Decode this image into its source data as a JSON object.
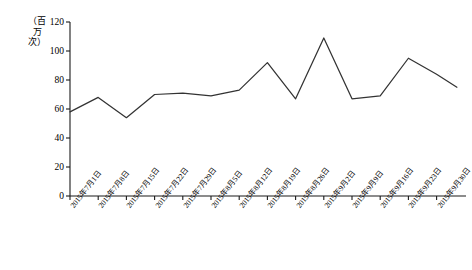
{
  "chart_data": {
    "type": "line",
    "title": "",
    "xlabel": "",
    "ylabel": "（百万次）",
    "ylim": [
      0,
      120
    ],
    "yticks": [
      0,
      20,
      40,
      60,
      80,
      100,
      120
    ],
    "grid": false,
    "legend": null,
    "series_color": "#333333",
    "categories": [
      "2015年7月1日",
      "2015年7月8日",
      "2015年7月15日",
      "2015年7月22日",
      "2015年7月29日",
      "2015年8月5日",
      "2015年8月12日",
      "2015年8月19日",
      "2015年8月26日",
      "2015年9月2日",
      "2015年9月9日",
      "2015年9月16日",
      "2015年9月23日",
      "2015年9月30日"
    ],
    "values": [
      58,
      68,
      54,
      70,
      71,
      69,
      73,
      92,
      67,
      109,
      67,
      69,
      95,
      84
    ],
    "series": [
      {
        "name": "访问量",
        "values": [
          58,
          68,
          54,
          70,
          71,
          69,
          73,
          92,
          67,
          109,
          67,
          69,
          95,
          84
        ]
      }
    ],
    "tail_point": {
      "x_fraction": 1.06,
      "value": 75
    }
  }
}
